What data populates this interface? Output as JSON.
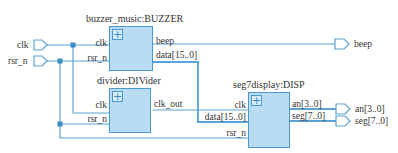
{
  "diagram": {
    "type": "rtl-schematic",
    "colors": {
      "wire": "#5ba3d6",
      "block_fill": "#b9dcf4",
      "block_border": "#4a98cf",
      "junction": "#3b8bc4"
    },
    "inputs": [
      {
        "id": "clk",
        "label": "clk"
      },
      {
        "id": "rsr_n",
        "label": "rsr_n"
      }
    ],
    "outputs": [
      {
        "id": "beep",
        "label": "beep"
      },
      {
        "id": "an",
        "label": "an[3..0]"
      },
      {
        "id": "seg",
        "label": "seg[7..0]"
      }
    ],
    "blocks": [
      {
        "id": "buzzer",
        "title": "buzzer_music:BUZZER",
        "expand": "+",
        "in_ports": [
          "clk",
          "rsr_n"
        ],
        "out_ports": [
          "beep",
          "data[15..0]"
        ]
      },
      {
        "id": "divider",
        "title": "divider:DIVider",
        "expand": "+",
        "in_ports": [
          "clk",
          "rsr_n"
        ],
        "out_ports": [
          "clk_out"
        ]
      },
      {
        "id": "disp",
        "title": "seg7display:DISP",
        "expand": "+",
        "in_ports": [
          "clk",
          "data[15..0]",
          "rsr_n"
        ],
        "out_ports": [
          "an[3..0]",
          "seg[7..0]"
        ]
      }
    ],
    "connections": [
      "clk -> BUZZER.clk",
      "clk -> DIVider.clk",
      "rsr_n -> BUZZER.rsr_n",
      "rsr_n -> DIVider.rsr_n",
      "rsr_n -> DISP.rsr_n",
      "BUZZER.beep -> beep",
      "BUZZER.data[15..0] -> DISP.data[15..0]",
      "DIVider.clk_out -> DISP.clk",
      "DISP.an[3..0] -> an[3..0]",
      "DISP.seg[7..0] -> seg[7..0]"
    ]
  }
}
